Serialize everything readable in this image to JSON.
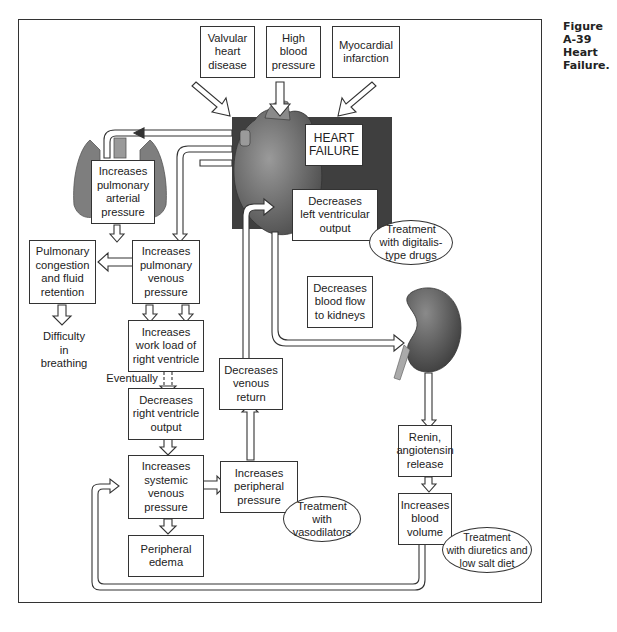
{
  "caption": {
    "figure_number": "Figure A-39",
    "title": "Heart Failure."
  },
  "causes": [
    {
      "id": "valvular",
      "text": "Valvular\nheart\ndisease"
    },
    {
      "id": "high-bp",
      "text": "High\nblood\npressure"
    },
    {
      "id": "mi",
      "text": "Myocardial\ninfarction"
    }
  ],
  "center": {
    "heart_failure": "HEART\nFAILURE",
    "decreases_lv_output": "Decreases\nleft ventricular\noutput"
  },
  "nodes": {
    "pulm_arterial": "Increases\npulmonary\narterial\npressure",
    "pulm_venous": "Increases\npulmonary\nvenous\npressure",
    "pulm_congestion": "Pulmonary\ncongestion\nand fluid\nretention",
    "difficulty_breathing": "Difficulty\nin\nbreathing",
    "workload_rv": "Increases\nwork load of\nright ventricle",
    "eventually": "Eventually",
    "decreases_rv_output": "Decreases\nright ventricle\noutput",
    "systemic_venous": "Increases\nsystemic\nvenous\npressure",
    "peripheral_edema": "Peripheral\nedema",
    "peripheral_pressure": "Increases\nperipheral\npressure",
    "venous_return": "Decreases\nvenous\nreturn",
    "blood_flow_kidneys": "Decreases\nblood flow\nto kidneys",
    "renin": "Renin,\nangiotensin\nrelease",
    "blood_volume": "Increases\nblood\nvolume"
  },
  "treatments": {
    "digitalis": "Treatment\nwith digitalis-\ntype drugs",
    "vasodilators": "Treatment\nwith\nvasodilators",
    "diuretics": "Treatment\nwith diuretics and\nlow salt diet"
  },
  "colors": {
    "dark_panel": "#3f3f3f",
    "heart": "#6a6a6a",
    "lung": "#7a7a7a",
    "kidney": "#5e5e5e",
    "line": "#333333"
  }
}
